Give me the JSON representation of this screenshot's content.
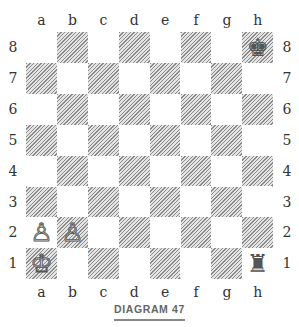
{
  "diagram": {
    "caption": "DIAGRAM 47",
    "files": [
      "a",
      "b",
      "c",
      "d",
      "e",
      "f",
      "g",
      "h"
    ],
    "ranks": [
      "8",
      "7",
      "6",
      "5",
      "4",
      "3",
      "2",
      "1"
    ],
    "pieces": [
      {
        "square": "h8",
        "type": "king",
        "color": "black",
        "glyph": "♚"
      },
      {
        "square": "h1",
        "type": "rook",
        "color": "black",
        "glyph": "♜"
      },
      {
        "square": "a1",
        "type": "king",
        "color": "white",
        "glyph": "♔"
      },
      {
        "square": "a2",
        "type": "pawn",
        "color": "white",
        "glyph": "♙"
      },
      {
        "square": "b2",
        "type": "pawn",
        "color": "white",
        "glyph": "♙"
      }
    ]
  }
}
